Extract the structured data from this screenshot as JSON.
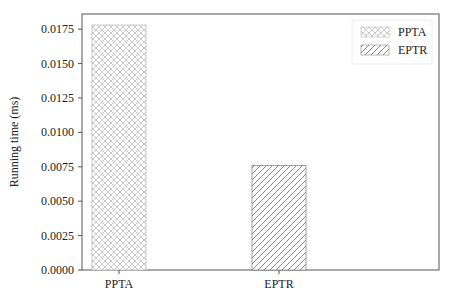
{
  "chart_data": {
    "type": "bar",
    "title": "",
    "xlabel": "",
    "ylabel": "Running time (ms)",
    "categories": [
      "PPTA",
      "EPTR"
    ],
    "values": [
      0.0178,
      0.0076
    ],
    "series": [
      {
        "name": "PPTA",
        "values": [
          0.0178,
          null
        ],
        "hatch": "crosshatch",
        "color": "#d9d9d9"
      },
      {
        "name": "EPTR",
        "values": [
          null,
          0.0076
        ],
        "hatch": "diagonal",
        "color": "#888888"
      }
    ],
    "ylim": [
      0,
      0.0186
    ],
    "yticks": [
      "0.0000",
      "0.0025",
      "0.0050",
      "0.0075",
      "0.0100",
      "0.0125",
      "0.0150",
      "0.0175"
    ],
    "legend": {
      "position": "upper right",
      "entries": [
        "PPTA",
        "EPTR"
      ]
    },
    "grid": false
  }
}
